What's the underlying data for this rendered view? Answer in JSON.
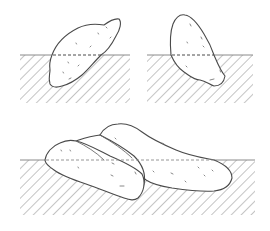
{
  "figure": {
    "colors": {
      "background": "#ffffff",
      "outline": "#4a4a4a",
      "hatch": "#8a8a8a"
    },
    "panels": [
      {
        "id": "top-left",
        "subject": "single elongated stone tilted diagonally, lower half buried",
        "ground_line_y": 55
      },
      {
        "id": "top-right",
        "subject": "single upright egg-shaped stone, lower half buried",
        "ground_line_y": 55
      },
      {
        "id": "bottom",
        "subject": "group of overlapping flat stones lying partly buried",
        "ground_line_y": 160
      }
    ]
  }
}
